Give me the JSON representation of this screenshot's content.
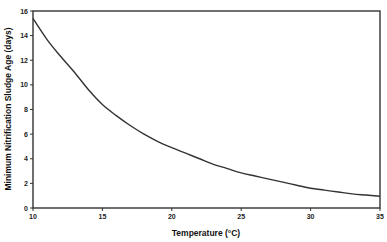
{
  "chart_data": {
    "type": "line",
    "title": "",
    "xlabel": "Temperature (°C)",
    "ylabel": "Minimum Nitrification Sludge Age (days)",
    "xlim": [
      10,
      35
    ],
    "ylim": [
      0,
      16
    ],
    "xticks": [
      10,
      15,
      20,
      25,
      30,
      35
    ],
    "yticks": [
      0,
      2,
      4,
      6,
      8,
      10,
      12,
      14,
      16
    ],
    "grid": false,
    "legend": null,
    "series": [
      {
        "name": "Minimum nitrification sludge age",
        "x": [
          10,
          11,
          12,
          13,
          14,
          15,
          16,
          17,
          18,
          19,
          20,
          21,
          22,
          23,
          24,
          25,
          26,
          27,
          28,
          29,
          30,
          31,
          32,
          33,
          34,
          35
        ],
        "values": [
          15.4,
          13.7,
          12.3,
          11.0,
          9.6,
          8.4,
          7.5,
          6.7,
          6.0,
          5.4,
          4.9,
          4.45,
          4.0,
          3.55,
          3.2,
          2.85,
          2.6,
          2.35,
          2.1,
          1.85,
          1.6,
          1.45,
          1.3,
          1.15,
          1.05,
          0.95
        ]
      }
    ]
  }
}
